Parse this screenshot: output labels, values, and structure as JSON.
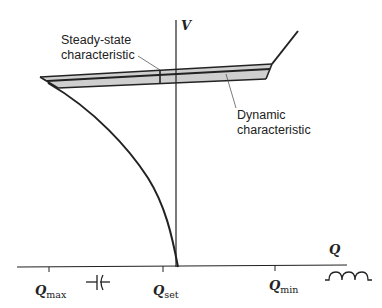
{
  "diagram": {
    "type": "voltage-reactive-power characteristic",
    "axes": {
      "y_label": "V",
      "x_label": "Q",
      "x_ticks": [
        {
          "main": "Q",
          "sub": "max"
        },
        {
          "main": "Q",
          "sub": "set"
        },
        {
          "main": "Q",
          "sub": "min"
        }
      ]
    },
    "annotations": {
      "steady_state": [
        "Steady-state",
        "characteristic"
      ],
      "dynamic": [
        "Dynamic",
        "characteristic"
      ]
    },
    "symbols": {
      "capacitor": "capacitor-symbol",
      "inductor": "inductor-symbol"
    },
    "colors": {
      "line": "#222222",
      "band_fill": "#cfcfcf",
      "background": "#ffffff"
    }
  }
}
